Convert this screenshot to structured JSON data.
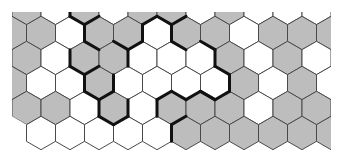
{
  "diagram": {
    "type": "hexagonal-grid",
    "orientation": "pointy-top",
    "colors": {
      "background": "#ffffff",
      "filled": "#bdbdbd",
      "empty": "#ffffff",
      "grid_line": "#4a4a4a",
      "boundary_line": "#111111"
    },
    "geometry": {
      "left": 12,
      "right": 331,
      "top": 12,
      "bottom": 158,
      "hex_width": 29,
      "row_pitch": 25,
      "side": 16.7,
      "row_center_y": [
        8,
        33,
        58,
        83,
        108,
        133
      ],
      "even_row_first_center_x": 26.5,
      "odd_row_first_center_x": 12
    },
    "rows": [
      [
        "G",
        "W",
        "G",
        "W",
        "G",
        "G",
        "W",
        "G",
        "W",
        "W",
        "W"
      ],
      [
        "G",
        "G",
        "W",
        "G",
        "G",
        "W",
        "G",
        "G",
        "W",
        "G",
        "G",
        "G"
      ],
      [
        "G",
        "W",
        "G",
        "G",
        "W",
        "W",
        "W",
        "G",
        "W",
        "G",
        "W"
      ],
      [
        "G",
        "W",
        "W",
        "G",
        "W",
        "W",
        "W",
        "W",
        "G",
        "W",
        "G",
        "W"
      ],
      [
        "G",
        "G",
        "W",
        "G",
        "W",
        "G",
        "G",
        "G",
        "W",
        "G",
        "G"
      ],
      [
        "-",
        "W",
        "W",
        "W",
        "W",
        "W",
        "G",
        "G",
        "G",
        "G",
        "G",
        "G"
      ]
    ],
    "boundary_edges": [
      [
        0,
        2,
        "left"
      ],
      [
        0,
        2,
        "bottom-left"
      ],
      [
        1,
        3,
        "top-left"
      ],
      [
        1,
        3,
        "left"
      ],
      [
        1,
        3,
        "bottom-left"
      ],
      [
        2,
        2,
        "left"
      ],
      [
        2,
        2,
        "bottom-left"
      ],
      [
        3,
        3,
        "top-left"
      ],
      [
        3,
        3,
        "left"
      ],
      [
        3,
        3,
        "bottom-left"
      ],
      [
        4,
        3,
        "left"
      ],
      [
        4,
        3,
        "bottom-left"
      ],
      [
        4,
        3,
        "bottom-right"
      ],
      [
        4,
        3,
        "right"
      ],
      [
        3,
        3,
        "right"
      ],
      [
        3,
        3,
        "bottom-right"
      ],
      [
        2,
        3,
        "right"
      ],
      [
        2,
        3,
        "top-right"
      ],
      [
        1,
        4,
        "right"
      ],
      [
        1,
        4,
        "bottom-right"
      ],
      [
        1,
        5,
        "top-left"
      ],
      [
        1,
        5,
        "top-right"
      ],
      [
        1,
        5,
        "right"
      ],
      [
        0,
        5,
        "bottom-right"
      ],
      [
        1,
        6,
        "bottom-left"
      ],
      [
        2,
        6,
        "top-right"
      ],
      [
        2,
        6,
        "right"
      ],
      [
        3,
        7,
        "top-right"
      ],
      [
        3,
        7,
        "right"
      ],
      [
        3,
        7,
        "bottom-right"
      ],
      [
        3,
        7,
        "bottom-left"
      ],
      [
        4,
        5,
        "top-left"
      ],
      [
        4,
        5,
        "top-right"
      ],
      [
        4,
        6,
        "top-left"
      ],
      [
        4,
        6,
        "top-right"
      ],
      [
        5,
        6,
        "left"
      ],
      [
        5,
        6,
        "top-left"
      ],
      [
        4,
        5,
        "left"
      ]
    ]
  }
}
